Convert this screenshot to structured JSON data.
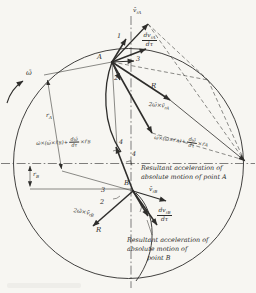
{
  "colors": {
    "paper": "#f7f6f2",
    "ink": "#2e2d2b"
  },
  "rotation": {
    "omega": "ω̄"
  },
  "points": {
    "a": "A",
    "b": "B"
  },
  "numbers": {
    "n1": "1",
    "n2a": "2",
    "n3a": "3",
    "n4a": "4",
    "n4b": "4",
    "n2b": "2",
    "n3b": "3"
  },
  "radii": {
    "ra": {
      "main": "r",
      "sub": "A"
    },
    "rb": {
      "main": "r",
      "sub": "B"
    }
  },
  "curvature": {
    "ra": "R",
    "rb": "R"
  },
  "vectors": {
    "vra": {
      "main": "v̄",
      "sub": "rA"
    },
    "vrb": {
      "main": "v̄",
      "sub": "rB"
    },
    "dvra": {
      "num": "dv",
      "num_sub": "rA",
      "den": "dτ"
    },
    "dvrb": {
      "num": "dv",
      "num_sub": "rB",
      "den": "dτ"
    },
    "cora": {
      "main": "2ω̄×v̄",
      "sub": "rA"
    },
    "corb": {
      "main": "2ω̄×v̄",
      "sub": "rB"
    },
    "transa": {
      "p1": "ω̄×(ω̄×r̄",
      "s1": "A",
      "p2": ")+",
      "num": "dω̄",
      "den": "dτ",
      "p3": "×r̄",
      "s2": "A"
    },
    "transb": {
      "p1": "ω̄×(ω̄×r̄",
      "s1": "B",
      "p2": ")+",
      "num": "dω̄",
      "den": "dτ",
      "p3": "×r̄",
      "s2": "B"
    }
  },
  "captions": {
    "a": [
      "Resultant acceleration of",
      "absolute motion of point A"
    ],
    "b": [
      "Resultant acceleration of",
      "absolute motion of",
      "point B"
    ]
  }
}
